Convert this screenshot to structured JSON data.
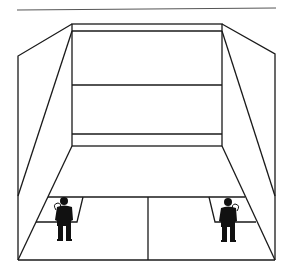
{
  "diagram": {
    "line_color": "#1a1a1a",
    "background": "#ffffff",
    "elements": {
      "front_wall": "front wall with out-line, service line and tin",
      "side_walls": [
        "left side wall",
        "right side wall"
      ],
      "floor": "court floor with short line, half-court line and service boxes",
      "players": [
        "left player in service box",
        "right player in service box"
      ]
    }
  }
}
